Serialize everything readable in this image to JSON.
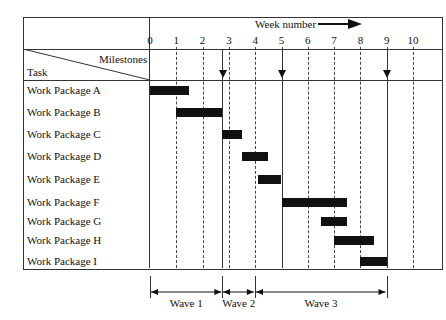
{
  "chart_data": {
    "type": "gantt",
    "title": "",
    "axis": {
      "label": "Week number",
      "ticks": [
        0,
        1,
        2,
        3,
        4,
        5,
        6,
        7,
        8,
        9,
        10
      ],
      "range": [
        0,
        10
      ]
    },
    "header": {
      "milestones_label": "Milestones",
      "task_label": "Task"
    },
    "tasks": [
      {
        "name": "Work Package A",
        "start": 0,
        "end": 1.5
      },
      {
        "name": "Work Package B",
        "start": 1,
        "end": 2.75
      },
      {
        "name": "Work Package C",
        "start": 2.75,
        "end": 3.5
      },
      {
        "name": "Work Package D",
        "start": 3.5,
        "end": 4.5
      },
      {
        "name": "Work Package E",
        "start": 4.1,
        "end": 5
      },
      {
        "name": "Work Package F",
        "start": 5,
        "end": 7.5
      },
      {
        "name": "Work Package G",
        "start": 6.5,
        "end": 7.5
      },
      {
        "name": "Work Package H",
        "start": 7,
        "end": 8.5
      },
      {
        "name": "Work Package I",
        "start": 8,
        "end": 9
      }
    ],
    "milestones": [
      2.75,
      5,
      9
    ],
    "waves": [
      {
        "label": "Wave 1",
        "start": 0,
        "end": 2.75
      },
      {
        "label": "Wave 2",
        "start": 2.75,
        "end": 4
      },
      {
        "label": "Wave 3",
        "start": 4,
        "end": 9
      }
    ]
  }
}
